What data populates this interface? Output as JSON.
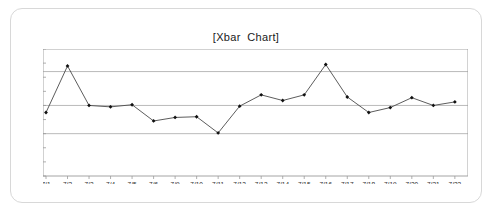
{
  "card": {
    "border_color": "#d8d8d8"
  },
  "chart_data": {
    "type": "line",
    "title": "[Xbar  Chart]",
    "xlabel": "",
    "ylabel": "",
    "categories": [
      "7/1",
      "7/2",
      "7/3",
      "7/4",
      "7/5",
      "7/6",
      "7/9",
      "7/10",
      "7/11",
      "7/12",
      "7/13",
      "7/14",
      "7/15",
      "7/16",
      "7/17",
      "7/18",
      "7/19",
      "7/20",
      "7/21",
      "7/22"
    ],
    "values": [
      599.5,
      602.8,
      600.0,
      599.9,
      600.05,
      598.9,
      599.15,
      599.2,
      598.05,
      599.95,
      600.75,
      600.35,
      600.75,
      602.9,
      600.6,
      599.5,
      599.85,
      600.55,
      600.0,
      600.25
    ],
    "ylim": [
      595,
      604
    ],
    "yticks": [
      604,
      603,
      602,
      601,
      600,
      599,
      598,
      597,
      596,
      595
    ],
    "grid": true,
    "legend": "none",
    "series_color": "#4a4a4a",
    "marker_color": "#111111",
    "control_lines": [
      {
        "name": "ucl",
        "value": 602.4,
        "color": "#a8a8a8"
      },
      {
        "name": "center",
        "value": 600,
        "color": "#a8a8a8"
      },
      {
        "name": "lcl",
        "value": 598,
        "color": "#a8a8a8"
      }
    ]
  }
}
